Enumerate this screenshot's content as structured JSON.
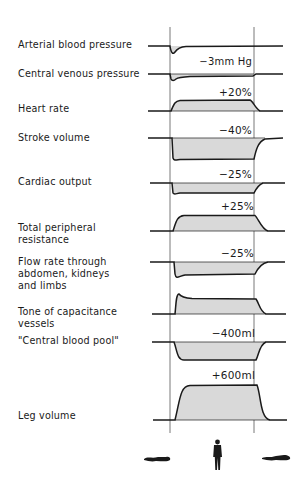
{
  "diagram": {
    "postures": [
      "supine",
      "standing",
      "supine"
    ],
    "rows": [
      {
        "label": "Arterial blood pressure",
        "change": ""
      },
      {
        "label": "Central venous pressure",
        "change": "−3mm Hg"
      },
      {
        "label": "Heart rate",
        "change": "+20%"
      },
      {
        "label": "Stroke volume",
        "change": "−40%"
      },
      {
        "label": "Cardiac output",
        "change": "−25%"
      },
      {
        "label": "Total peripheral resistance",
        "label_lines": [
          "Total peripheral",
          "resistance"
        ],
        "change": "+25%"
      },
      {
        "label": "Flow rate through abdomen, kidneys and limbs",
        "label_lines": [
          "Flow rate through",
          "abdomen, kidneys",
          "and limbs"
        ],
        "change": "−25%"
      },
      {
        "label": "Tone of capacitance vessels",
        "label_lines": [
          "Tone of capacitance",
          "vessels"
        ],
        "change": ""
      },
      {
        "label": "\"Central blood pool\"",
        "change": "−400ml"
      },
      {
        "label": "Leg volume",
        "change": "+600ml"
      }
    ],
    "colors": {
      "line": "#1a1a1a",
      "fill": "#d8d8d8",
      "guide": "#555555"
    }
  }
}
